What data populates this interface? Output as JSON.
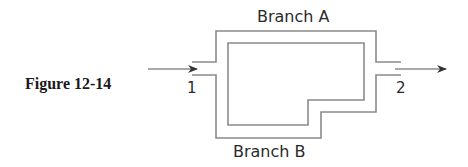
{
  "figure": {
    "caption": "Figure 12-14"
  },
  "labels": {
    "branch_a": "Branch A",
    "branch_b": "Branch B",
    "inlet": "1",
    "outlet": "2"
  },
  "colors": {
    "pipe_wall": "#8a8a8a",
    "arrow": "#555555",
    "text": "#2a2a2a",
    "caption": "#1a1a1a",
    "background": "#ffffff"
  },
  "diagram": {
    "type": "parallel pipe network",
    "inlet_station": "1",
    "outlet_station": "2",
    "branches": [
      {
        "name": "Branch A",
        "route": "upper loop"
      },
      {
        "name": "Branch B",
        "route": "lower loop with step"
      }
    ],
    "flow_direction": "left-to-right"
  }
}
